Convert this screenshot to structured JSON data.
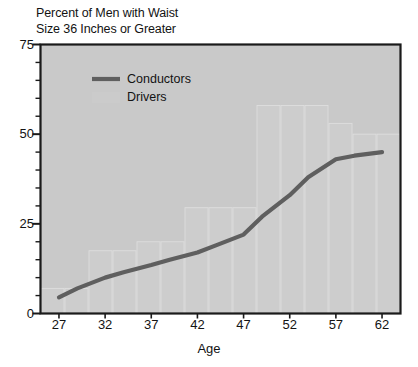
{
  "chart_data": {
    "type": "line",
    "title_line1": "Percent of Men with Waist",
    "title_line2": "Size 36 Inches or Greater",
    "xlabel": "Age",
    "ylabel": "",
    "xlim": [
      25,
      64
    ],
    "ylim": [
      0,
      75
    ],
    "ytick_labels": [
      "0",
      "25",
      "50",
      "75"
    ],
    "ytick_values": [
      0,
      25,
      50,
      75
    ],
    "yminor_step": 5,
    "xtick_labels": [
      "27",
      "32",
      "37",
      "42",
      "47",
      "52",
      "57",
      "62"
    ],
    "xtick_values": [
      27,
      32,
      37,
      42,
      47,
      52,
      57,
      62
    ],
    "grid": false,
    "legend_position": "upper-left-inside",
    "legend": [
      {
        "name": "Conductors",
        "kind": "line",
        "color": "#5f5f5f"
      },
      {
        "name": "Drivers",
        "kind": "bar",
        "color": "#cccccc"
      }
    ],
    "series": [
      {
        "name": "Conductors",
        "kind": "line",
        "color": "#5f5f5f",
        "x": [
          27,
          29,
          32,
          34,
          37,
          39,
          42,
          44,
          47,
          49,
          52,
          54,
          57,
          59,
          62
        ],
        "values": [
          4.5,
          7.0,
          10.0,
          11.5,
          13.5,
          15.0,
          17.0,
          19.0,
          22.0,
          27.0,
          33.0,
          38.0,
          43.0,
          44.0,
          45.0
        ]
      },
      {
        "name": "Drivers",
        "kind": "bar",
        "color": "#cfcfcf",
        "categories": [
          27,
          29,
          32,
          34,
          37,
          39,
          42,
          44,
          47,
          49,
          52,
          54,
          57,
          59,
          62
        ],
        "values": [
          7.0,
          7.0,
          17.5,
          17.5,
          20.0,
          20.0,
          29.5,
          29.5,
          29.5,
          58.0,
          58.0,
          58.0,
          53.0,
          50.0,
          50.0
        ]
      }
    ]
  },
  "axes": {
    "frame_color": "#1a1a1a",
    "plot_background": "#c9c9c9",
    "page_background": "#ffffff"
  }
}
